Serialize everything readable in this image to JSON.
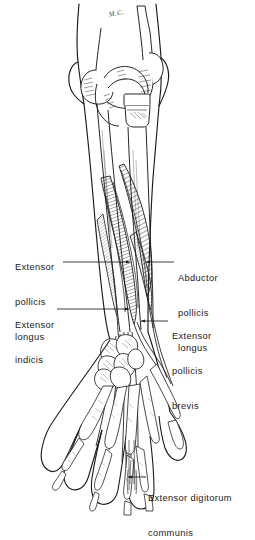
{
  "figure": {
    "view": "posterior",
    "side": "right",
    "monogram": "M.C.",
    "background_color": "#ffffff",
    "ink_color": "#1a1a1a",
    "style": "pen-and-ink line drawing with diagonal hatching"
  },
  "labels": [
    {
      "id": "epl",
      "side": "left",
      "lines": [
        "Extensor",
        "pollicis",
        "longus"
      ],
      "line1": "Extensor",
      "line2": "pollicis",
      "line3": "longus",
      "leader_from": [
        88,
        262
      ],
      "leader_to": [
        132,
        262
      ]
    },
    {
      "id": "ei",
      "side": "left",
      "lines": [
        "Extensor",
        "indicis"
      ],
      "line1": "Extensor",
      "line2": "indicis",
      "leader_from": [
        68,
        309
      ],
      "leader_to": [
        131,
        309
      ]
    },
    {
      "id": "apl",
      "side": "right",
      "lines": [
        "Abductor",
        "pollicis",
        "longus"
      ],
      "line1": "Abductor",
      "line2": "pollicis",
      "line3": "longus",
      "leader_from": [
        172,
        262
      ],
      "leader_to": [
        144,
        262
      ]
    },
    {
      "id": "epb",
      "side": "right",
      "lines": [
        "Extensor",
        "pollicis",
        "brevis"
      ],
      "line1": "Extensor",
      "line2": "pollicis",
      "line3": "brevis",
      "leader_from": [
        166,
        321
      ],
      "leader_to": [
        139,
        321
      ]
    },
    {
      "id": "edc",
      "side": "right",
      "lines": [
        "Extensor digitorum",
        "communis"
      ],
      "line1": "Extensor digitorum",
      "line2": "communis",
      "leader_from": [
        144,
        477
      ],
      "leader_to": [
        128,
        477
      ]
    }
  ],
  "structures": {
    "skin_outline": "forearm and hand silhouette",
    "elbow": "humeral condyles, olecranon, radial head",
    "bones": "radius, ulna, carpals, metacarpals, phalanges",
    "muscles": "abductor pollicis longus, extensor pollicis brevis, extensor pollicis longus, extensor indicis",
    "tendons": "extensor digitorum communis tendons to fingers"
  }
}
